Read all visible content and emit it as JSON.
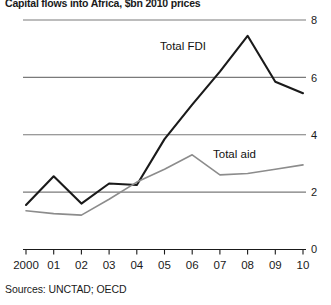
{
  "chart_data": {
    "type": "line",
    "title": "Capital flows into Africa, $bn 2010 prices",
    "xlabel": "",
    "ylabel": "",
    "ylim": [
      0,
      8
    ],
    "yticks": [
      0,
      2,
      4,
      6,
      8
    ],
    "ytick_labels": [
      "0",
      "2",
      "4",
      "6",
      "8"
    ],
    "y_axis_position": "right",
    "grid": true,
    "grid_values": [
      2,
      4,
      6,
      8
    ],
    "categories": [
      "2000",
      "01",
      "02",
      "03",
      "04",
      "05",
      "06",
      "07",
      "08",
      "09",
      "10"
    ],
    "x": [
      2000,
      2001,
      2002,
      2003,
      2004,
      2005,
      2006,
      2007,
      2008,
      2009,
      2010
    ],
    "series": [
      {
        "name": "Total FDI",
        "color": "#1a1a1a",
        "width": 2.1,
        "values": [
          1.55,
          2.55,
          1.6,
          2.3,
          2.25,
          3.85,
          5.05,
          6.2,
          7.45,
          5.85,
          5.45
        ]
      },
      {
        "name": "Total aid",
        "color": "#8c8c8c",
        "width": 1.6,
        "values": [
          1.35,
          1.25,
          1.2,
          1.75,
          2.35,
          2.8,
          3.3,
          2.6,
          2.65,
          2.8,
          2.95
        ]
      }
    ],
    "annotations": [
      {
        "text": "Total FDI",
        "x": 160,
        "y": 40
      },
      {
        "text": "Total aid",
        "x": 213,
        "y": 148
      }
    ],
    "source": "Sources: UNCTAD; OECD",
    "colors": {
      "fdi_line": "#1a1a1a",
      "aid_line": "#8c8c8c",
      "grid": "#7a7a7a",
      "axis": "#1a1a1a",
      "background": "#ffffff"
    }
  }
}
